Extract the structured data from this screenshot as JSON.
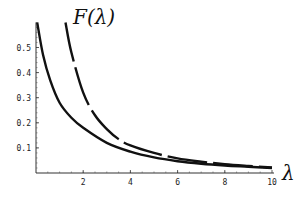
{
  "chart_data": {
    "type": "line",
    "title": "",
    "xlabel": "λ",
    "ylabel": "F(λ)",
    "xlim": [
      0,
      10
    ],
    "ylim": [
      0,
      0.6
    ],
    "grid": false,
    "legend": null,
    "x_ticks": [
      2,
      4,
      6,
      8,
      10
    ],
    "x_tick_labels": [
      "2",
      "4",
      "6",
      "8",
      "10"
    ],
    "y_ticks": [
      0.1,
      0.2,
      0.3,
      0.4,
      0.5
    ],
    "y_tick_labels": [
      "0.1",
      "0.2",
      "0.3",
      "0.4",
      "0.5"
    ],
    "series": [
      {
        "name": "solid",
        "style": "solid",
        "x": [
          0.05,
          0.3,
          0.6,
          1.0,
          1.5,
          2.0,
          3.0,
          4.0,
          5.0,
          6.0,
          7.0,
          8.0,
          9.0,
          10.0
        ],
        "y": [
          0.6,
          0.47,
          0.37,
          0.28,
          0.22,
          0.18,
          0.12,
          0.085,
          0.062,
          0.047,
          0.037,
          0.03,
          0.025,
          0.02
        ]
      },
      {
        "name": "dashed",
        "style": "dashed",
        "x": [
          1.25,
          1.5,
          2.0,
          2.5,
          3.0,
          3.5,
          4.0,
          5.0,
          6.0,
          7.0,
          8.0,
          9.0,
          10.0
        ],
        "y": [
          0.6,
          0.48,
          0.32,
          0.23,
          0.175,
          0.135,
          0.11,
          0.08,
          0.058,
          0.045,
          0.035,
          0.028,
          0.022
        ]
      }
    ]
  },
  "labels": {
    "y_axis_title": "F(λ)",
    "x_axis_title": "λ"
  }
}
